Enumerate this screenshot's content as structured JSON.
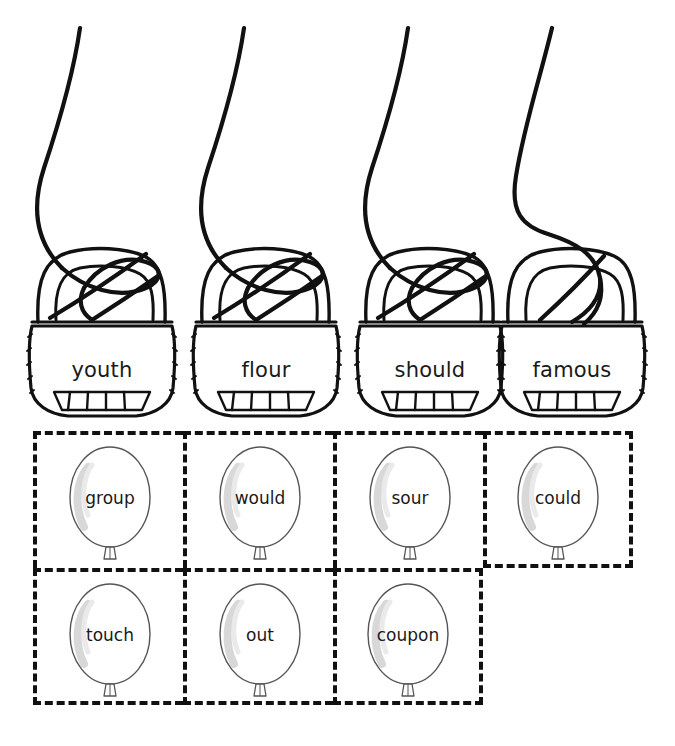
{
  "worksheet": {
    "title": "Word Sort Worksheet",
    "colors": {
      "ink": "#1a1a1a",
      "dash": "#111111",
      "balloon_outline": "#555555",
      "balloon_highlight": "#d8d8d8",
      "background": "#ffffff"
    }
  },
  "baskets": {
    "icon": "basket-icon",
    "items": [
      {
        "label": "youth",
        "ribbon": "looped"
      },
      {
        "label": "flour",
        "ribbon": "looped"
      },
      {
        "label": "should",
        "ribbon": "looped"
      },
      {
        "label": "famous",
        "ribbon": "s-curve"
      }
    ]
  },
  "balloon_grid": {
    "icon": "balloon-icon",
    "rows": [
      {
        "cells": [
          {
            "label": "group"
          },
          {
            "label": "would"
          },
          {
            "label": "sour"
          },
          {
            "label": "could"
          }
        ]
      },
      {
        "cells": [
          {
            "label": "touch"
          },
          {
            "label": "out"
          },
          {
            "label": "coupon"
          }
        ]
      }
    ]
  }
}
